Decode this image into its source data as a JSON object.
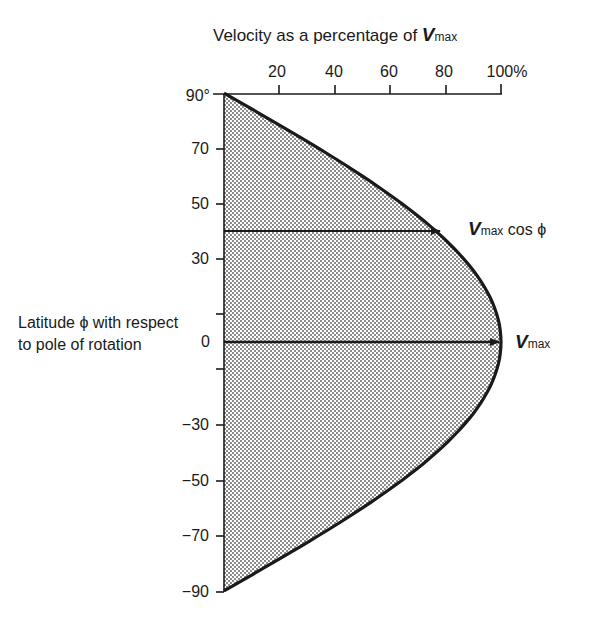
{
  "title": {
    "prefix": "Velocity as a percentage of ",
    "symbol": "V",
    "subscript": "max"
  },
  "x_axis": {
    "ticks": [
      "20",
      "40",
      "60",
      "80",
      "100%"
    ]
  },
  "y_axis": {
    "ticks": [
      "90°",
      "70",
      "50",
      "30",
      "0",
      "−30",
      "−50",
      "−70",
      "−90"
    ],
    "label": "Latitude ϕ with respect to pole of rotation"
  },
  "annotations": {
    "cos_label": {
      "symbol": "V",
      "subscript": "max",
      "suffix": " cos ϕ"
    },
    "max_label": {
      "symbol": "V",
      "subscript": "max"
    }
  },
  "colors": {
    "ink": "#1a1a1a",
    "fill": "#d6d6d6",
    "background": "#ffffff"
  },
  "chart_data": {
    "type": "area",
    "title": "Velocity as a percentage of Vmax",
    "xlabel": "Velocity (% of Vmax)",
    "ylabel": "Latitude ϕ with respect to pole of rotation",
    "x_ticks": [
      20,
      40,
      60,
      80,
      100
    ],
    "y_ticks": [
      90,
      70,
      50,
      30,
      0,
      -30,
      -50,
      -70,
      -90
    ],
    "xlim": [
      0,
      100
    ],
    "ylim": [
      -90,
      90
    ],
    "function": "v = 100 * cos(ϕ)",
    "series": [
      {
        "name": "velocity profile",
        "latitude": [
          90,
          70,
          50,
          40,
          30,
          10,
          0,
          -10,
          -30,
          -50,
          -70,
          -90
        ],
        "velocity_pct": [
          0,
          34.2,
          64.3,
          76.6,
          86.6,
          98.5,
          100,
          98.5,
          86.6,
          64.3,
          34.2,
          0
        ]
      }
    ],
    "arrows": [
      {
        "latitude": 40,
        "velocity_pct": 76.6,
        "label": "Vmax cos ϕ"
      },
      {
        "latitude": 0,
        "velocity_pct": 100,
        "label": "Vmax"
      }
    ]
  }
}
